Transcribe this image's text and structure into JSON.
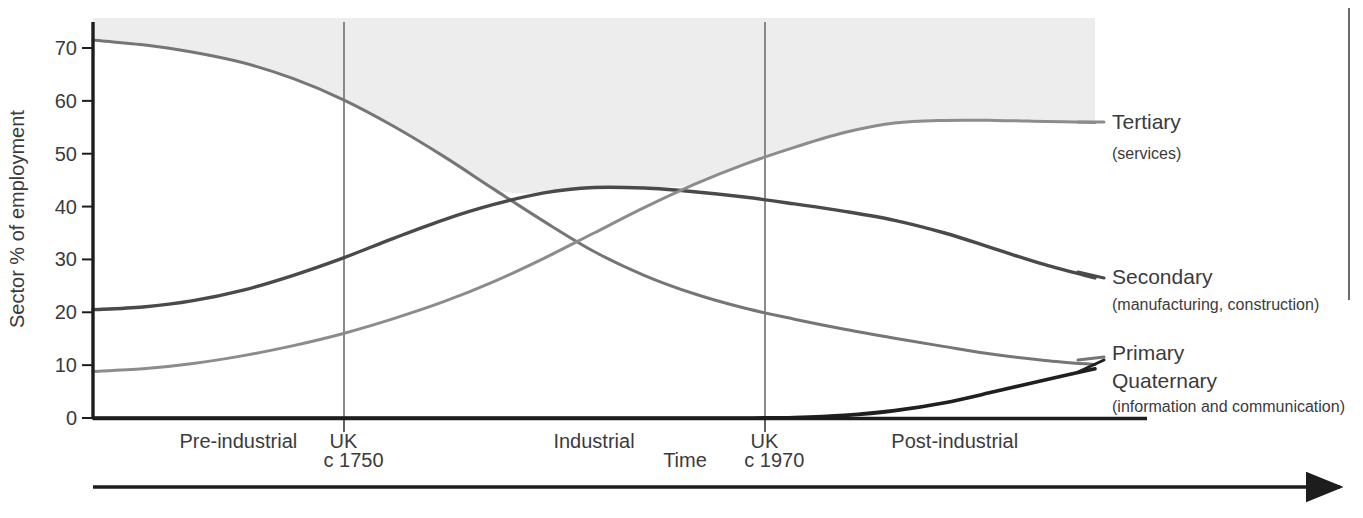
{
  "figure": {
    "background_color": "#ffffff",
    "plot_fill_color": "#ededed",
    "axis_color": "#1d1d1d"
  },
  "axes": {
    "y_title": "Sector % of employment",
    "y_ticks": [
      "0",
      "10",
      "20",
      "30",
      "40",
      "50",
      "60",
      "70"
    ],
    "y_tick_values": [
      0,
      10,
      20,
      30,
      40,
      50,
      60,
      70
    ],
    "y_min": 0,
    "y_max": 75,
    "x_title": "Time",
    "x_arrow": "right-arrow"
  },
  "eras": [
    {
      "label": "Pre-industrial",
      "center_pct": 14.5
    },
    {
      "label": "UK",
      "center_pct": 25.0,
      "date": "c 1750"
    },
    {
      "label": "Industrial",
      "center_pct": 50.0
    },
    {
      "label": "UK",
      "center_pct": 67.0,
      "date": "c 1970"
    },
    {
      "label": "Post-industrial",
      "center_pct": 86.0
    }
  ],
  "markers": [
    {
      "name": "uk-1750",
      "label": "UK",
      "date": "c 1750",
      "x_pct": 25.0
    },
    {
      "name": "uk-1970",
      "label": "UK",
      "date": "c 1970",
      "x_pct": 67.0
    }
  ],
  "legend": [
    {
      "key": "tertiary",
      "label": "Tertiary",
      "sublabel": "(services)",
      "color": "#8c8c8c"
    },
    {
      "key": "secondary",
      "label": "Secondary",
      "sublabel": "(manufacturing, construction)",
      "color": "#4a4a4a"
    },
    {
      "key": "primary",
      "label": "Primary",
      "sublabel": "",
      "color": "#767676"
    },
    {
      "key": "quaternary",
      "label": "Quaternary",
      "sublabel": "(information and communication)",
      "color": "#1f1f1f"
    }
  ],
  "chart_data": {
    "type": "line",
    "title": "",
    "subtitle": "",
    "xlabel": "Time",
    "ylabel": "Sector % of employment",
    "ylim": [
      0,
      75
    ],
    "xlim": [
      0,
      100
    ],
    "grid": false,
    "legend_position": "right",
    "x_axis_kind": "qualitative-time",
    "x_tick_labels": [
      "Pre-industrial",
      "UK",
      "Industrial",
      "UK",
      "Post-industrial"
    ],
    "annotations": [
      "c 1750",
      "c 1970"
    ],
    "x": [
      0,
      5,
      10,
      15,
      20,
      25,
      30,
      35,
      40,
      45,
      50,
      55,
      60,
      65,
      70,
      75,
      80,
      85,
      90,
      95,
      100
    ],
    "series": [
      {
        "name": "Primary",
        "color": "#767676",
        "values": [
          71.5,
          70.6,
          69.2,
          67.2,
          64.2,
          60.2,
          55.2,
          49.5,
          43.3,
          37.2,
          31.5,
          27.0,
          23.5,
          20.8,
          18.7,
          16.8,
          15.1,
          13.5,
          12.0,
          10.9,
          10.1
        ]
      },
      {
        "name": "Secondary",
        "color": "#4a4a4a",
        "values": [
          20.5,
          21.0,
          22.2,
          24.2,
          27.0,
          30.3,
          34.0,
          37.5,
          40.4,
          42.6,
          43.6,
          43.5,
          42.8,
          41.8,
          40.5,
          39.1,
          37.4,
          35.0,
          32.0,
          29.0,
          26.5
        ]
      },
      {
        "name": "Tertiary",
        "color": "#8c8c8c",
        "values": [
          8.8,
          9.3,
          10.3,
          11.8,
          13.7,
          16.0,
          18.8,
          22.0,
          25.8,
          30.2,
          35.0,
          39.8,
          44.2,
          48.0,
          51.2,
          54.0,
          55.8,
          56.3,
          56.3,
          56.1,
          55.9
        ]
      },
      {
        "name": "Quaternary",
        "color": "#1f1f1f",
        "values": [
          0,
          0,
          0,
          0,
          0,
          0,
          0,
          0,
          0,
          0,
          0,
          0,
          0,
          0,
          0.1,
          0.5,
          1.4,
          2.9,
          5.0,
          7.2,
          9.3
        ]
      }
    ]
  }
}
